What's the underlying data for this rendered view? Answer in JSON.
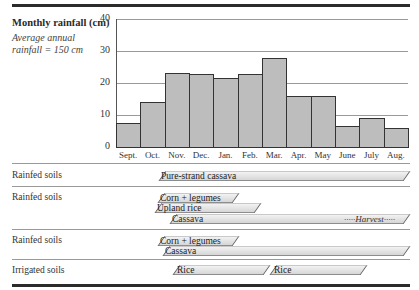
{
  "chart_data": {
    "type": "bar",
    "title": "Monthly rainfall (cm)",
    "subtitle": "Average annual rainfall = 150 cm",
    "xlabel": "",
    "ylabel": "Monthly rainfall (cm)",
    "ylim": [
      0,
      40
    ],
    "yticks": [
      "0",
      "10",
      "20",
      "30",
      "40"
    ],
    "grid": true,
    "categories": [
      "Sept.",
      "Oct.",
      "Nov.",
      "Dec.",
      "Jan.",
      "Feb.",
      "Mar.",
      "Apr.",
      "May",
      "June",
      "July",
      "Aug."
    ],
    "values": [
      7.5,
      14,
      23,
      22.8,
      21.5,
      22.8,
      27.8,
      16,
      16,
      6.5,
      9,
      6
    ]
  },
  "header": {
    "title": "Monthly rainfall (cm)",
    "subtitle_line1": "Average annual",
    "subtitle_line2": "rainfall = 150 cm"
  },
  "cropping_rows": [
    {
      "label": "Rainfed soils",
      "bands": [
        {
          "text": "Pure-strand cassava",
          "start_month": "Sept.",
          "end_month": "Aug."
        }
      ]
    },
    {
      "label": "Rainfed soils",
      "bands": [
        {
          "text": "Corn + legumes",
          "start_month": "Sept.",
          "end_month": "Dec."
        },
        {
          "text": "Upland rice",
          "start_month": "Sept.",
          "end_month": "Jan."
        },
        {
          "text": "Cassava",
          "start_month": "Oct.",
          "end_month": "Aug.",
          "note": "Harvest"
        }
      ]
    },
    {
      "label": "Rainfed soils",
      "bands": [
        {
          "text": "Corn + legumes",
          "start_month": "Sept.",
          "end_month": "Dec."
        },
        {
          "text": "Cassava",
          "start_month": "Oct.",
          "end_month": "Aug."
        }
      ]
    },
    {
      "label": "Irrigated soils",
      "bands": [
        {
          "text": "Rice",
          "start_month": "Oct.",
          "end_month": "Feb."
        },
        {
          "text": "Rice",
          "start_month": "Feb.",
          "end_month": "June"
        }
      ]
    }
  ],
  "harvest_text": "Harvest",
  "harvest_dots": "·····"
}
